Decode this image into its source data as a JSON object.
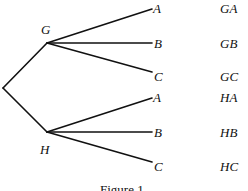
{
  "diagram": {
    "type": "tree-diagram",
    "nodes": {
      "first_level": [
        {
          "label": "G"
        },
        {
          "label": "H"
        }
      ],
      "second_level": {
        "G": [
          {
            "label": "A"
          },
          {
            "label": "B"
          },
          {
            "label": "C"
          }
        ],
        "H": [
          {
            "label": "A"
          },
          {
            "label": "B"
          },
          {
            "label": "C"
          }
        ]
      }
    },
    "outcomes": [
      "GA",
      "GB",
      "GC",
      "HA",
      "HB",
      "HC"
    ],
    "caption": "Figure 1"
  }
}
